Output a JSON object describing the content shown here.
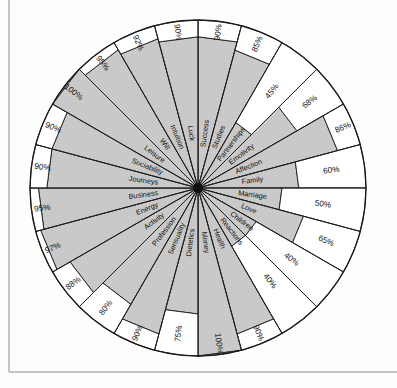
{
  "page": {
    "margin_rules": [
      "left-vertical-rule",
      "bottom-horizontal-rule"
    ]
  },
  "chart_data": {
    "type": "radar",
    "title": "",
    "subtitle": "",
    "xlabel": "",
    "ylabel": "",
    "ylim": [
      0,
      100
    ],
    "grid": false,
    "legend": "none",
    "units": "%",
    "sector_count": 24,
    "start_angle_deg": -90,
    "direction": "clockwise",
    "fill_color": "#c9c9c9",
    "line_color": "#1a1a1a",
    "background_color": "#ffffff",
    "categories": [
      "Success",
      "Studies",
      "Partnerships",
      "Emotivity",
      "Affection",
      "Family",
      "Marriage",
      "Love",
      "Children",
      "Reactions",
      "Health",
      "Money",
      "Dietetics",
      "Sensuality",
      "Profession",
      "Activity",
      "Energy",
      "Business",
      "Journeys",
      "Sociability",
      "Leisure",
      "Will",
      "Intuition",
      "Luck"
    ],
    "values": [
      90,
      85,
      45,
      68,
      86,
      60,
      50,
      65,
      40,
      40,
      90,
      100,
      75,
      90,
      80,
      88,
      97,
      95,
      90,
      90,
      100,
      95,
      92,
      90
    ],
    "value_labels": [
      "90%",
      "85%",
      "45%",
      "68%",
      "86%",
      "60%",
      "50%",
      "65%",
      "40%",
      "40%",
      "90%",
      "100%",
      "75%",
      "90%",
      "80%",
      "88%",
      "97%",
      "95%",
      "90%",
      "90%",
      "100%",
      "95%",
      "92%",
      "90%"
    ]
  }
}
